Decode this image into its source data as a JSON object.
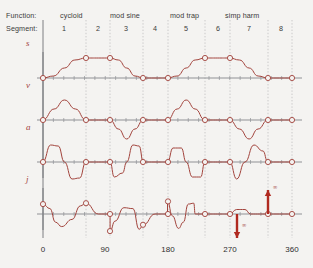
{
  "header": {
    "function_label": "Function:",
    "segment_label": "Segment:",
    "functions": [
      {
        "name": "cycloid",
        "x": 60
      },
      {
        "name": "mod sine",
        "x": 110
      },
      {
        "name": "mod trap",
        "x": 170
      },
      {
        "name": "simp harm",
        "x": 225
      }
    ],
    "segments": [
      {
        "number": "1",
        "x": 64
      },
      {
        "number": "2",
        "x": 98
      },
      {
        "number": "3",
        "x": 126
      },
      {
        "number": "4",
        "x": 155
      },
      {
        "number": "5",
        "x": 186
      },
      {
        "number": "6",
        "x": 218
      },
      {
        "number": "7",
        "x": 249
      },
      {
        "number": "8",
        "x": 281
      }
    ]
  },
  "axis": {
    "x_ticks": [
      {
        "label": "0",
        "x": 43
      },
      {
        "label": "90",
        "x": 105
      },
      {
        "label": "180",
        "x": 168
      },
      {
        "label": "270",
        "x": 230
      },
      {
        "label": "360",
        "x": 292
      }
    ],
    "x_min": 0,
    "x_max": 360,
    "units": "degrees"
  },
  "colors": {
    "curve": "#a2433c",
    "axis": "#8f9296",
    "gridline": "#b8b8b8",
    "text": "#3b3b3b",
    "background": "#f4f3f1",
    "arrow": "#b02a20"
  },
  "rows": [
    {
      "label": "s",
      "name": "displacement",
      "y": 78
    },
    {
      "label": "v",
      "name": "velocity",
      "y": 120
    },
    {
      "label": "a",
      "name": "acceleration",
      "y": 162
    },
    {
      "label": "j",
      "name": "jerk",
      "y": 214
    }
  ],
  "annotations": [
    {
      "symbol": "∞",
      "direction": "down",
      "x": 237,
      "y": 214
    },
    {
      "symbol": "∞",
      "direction": "up",
      "x": 268,
      "y": 214
    }
  ],
  "segment_boundaries_x": [
    43,
    86,
    110,
    143,
    168,
    205,
    230,
    268,
    292
  ],
  "chart_data": {
    "type": "line",
    "title": "",
    "xlabel": "",
    "ylabel": "",
    "xlim": [
      0,
      360
    ],
    "x_tick_values": [
      0,
      90,
      180,
      270,
      360
    ],
    "grid": true,
    "legend": "none",
    "segment_boundaries_deg": [
      0,
      62,
      97,
      145,
      180,
      234,
      270,
      325,
      360
    ],
    "segment_functions": [
      "cycloid",
      "cycloid",
      "mod sine",
      "mod sine",
      "mod trap",
      "mod trap",
      "simp harm",
      "simp harm"
    ],
    "series": [
      {
        "name": "s",
        "description": "displacement: rise 0-62, dwell high 62-97, fall 97-145, dwell low 145-180, rise 180-234, dwell high 234-270, fall 270-325, dwell low 325-360",
        "points": [
          [
            0,
            0
          ],
          [
            15,
            0.1
          ],
          [
            31,
            0.5
          ],
          [
            46,
            0.9
          ],
          [
            62,
            1.0
          ],
          [
            80,
            1.0
          ],
          [
            97,
            1.0
          ],
          [
            109,
            0.9
          ],
          [
            121,
            0.5
          ],
          [
            133,
            0.1
          ],
          [
            145,
            0
          ],
          [
            162,
            0
          ],
          [
            180,
            0
          ],
          [
            194,
            0.1
          ],
          [
            207,
            0.5
          ],
          [
            220,
            0.9
          ],
          [
            234,
            1.0
          ],
          [
            252,
            1.0
          ],
          [
            270,
            1.0
          ],
          [
            284,
            0.9
          ],
          [
            298,
            0.5
          ],
          [
            311,
            0.1
          ],
          [
            325,
            0
          ],
          [
            342,
            0
          ],
          [
            360,
            0
          ]
        ]
      },
      {
        "name": "v",
        "description": "velocity: positive hump over rise, zero in dwells, negative dip over fall",
        "points": [
          [
            0,
            0
          ],
          [
            16,
            0.55
          ],
          [
            31,
            1.0
          ],
          [
            47,
            0.55
          ],
          [
            62,
            0
          ],
          [
            80,
            0
          ],
          [
            97,
            0
          ],
          [
            109,
            -0.45
          ],
          [
            121,
            -0.95
          ],
          [
            133,
            -0.45
          ],
          [
            145,
            0
          ],
          [
            162,
            0
          ],
          [
            180,
            0
          ],
          [
            194,
            0.55
          ],
          [
            207,
            1.0
          ],
          [
            220,
            0.55
          ],
          [
            234,
            0
          ],
          [
            252,
            0
          ],
          [
            270,
            0
          ],
          [
            284,
            -0.45
          ],
          [
            298,
            -0.95
          ],
          [
            311,
            -0.45
          ],
          [
            325,
            0
          ],
          [
            342,
            0
          ],
          [
            360,
            0
          ]
        ]
      },
      {
        "name": "a",
        "description": "acceleration: one positive then negative lobe per rise/fall segment, zero in dwells",
        "points": [
          [
            0,
            0
          ],
          [
            11,
            0.85
          ],
          [
            22,
            0.8
          ],
          [
            31,
            0
          ],
          [
            42,
            -0.85
          ],
          [
            53,
            -0.8
          ],
          [
            62,
            0
          ],
          [
            80,
            0
          ],
          [
            97,
            0
          ],
          [
            103,
            -0.75
          ],
          [
            115,
            -0.55
          ],
          [
            121,
            0
          ],
          [
            130,
            0.85
          ],
          [
            139,
            0.8
          ],
          [
            145,
            0
          ],
          [
            162,
            0
          ],
          [
            180,
            0
          ],
          [
            188,
            0.7
          ],
          [
            200,
            0.7
          ],
          [
            207,
            0
          ],
          [
            216,
            -0.75
          ],
          [
            228,
            -0.75
          ],
          [
            234,
            0
          ],
          [
            252,
            0
          ],
          [
            270,
            0
          ],
          [
            280,
            -0.85
          ],
          [
            292,
            0
          ],
          [
            305,
            0.85
          ],
          [
            318,
            0.55
          ],
          [
            325,
            0
          ],
          [
            342,
            0
          ],
          [
            360,
            0
          ]
        ]
      },
      {
        "name": "j",
        "description": "jerk: derivative of acceleration; infinite (impulse) discontinuities at 270 and 325",
        "points": [
          [
            0,
            0.55
          ],
          [
            10,
            0.3
          ],
          [
            18,
            -0.45
          ],
          [
            27,
            -0.7
          ],
          [
            42,
            -0.3
          ],
          [
            54,
            0.45
          ],
          [
            62,
            0.6
          ],
          [
            80,
            0
          ],
          [
            97,
            0
          ],
          [
            97,
            -0.95
          ],
          [
            104,
            -0.4
          ],
          [
            117,
            0.35
          ],
          [
            130,
            0.3
          ],
          [
            139,
            -0.85
          ],
          [
            145,
            -0.6
          ],
          [
            162,
            0
          ],
          [
            180,
            0
          ],
          [
            180,
            0.7
          ],
          [
            187,
            -0.1
          ],
          [
            196,
            -0.8
          ],
          [
            203,
            -0.45
          ],
          [
            210,
            0.55
          ],
          [
            218,
            0.6
          ],
          [
            220,
            0
          ],
          [
            234,
            0
          ],
          [
            252,
            0
          ],
          [
            270,
            0
          ],
          [
            280,
            0.25
          ],
          [
            292,
            0.25
          ],
          [
            300,
            0
          ],
          [
            325,
            0
          ],
          [
            342,
            0
          ],
          [
            360,
            0
          ]
        ],
        "infinite_spikes": [
          {
            "deg": 270,
            "direction": "down",
            "label": "∞"
          },
          {
            "deg": 325,
            "direction": "up",
            "label": "∞"
          }
        ]
      }
    ]
  }
}
